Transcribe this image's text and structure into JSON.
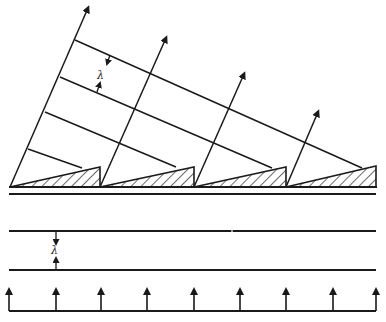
{
  "diagram": {
    "title": "",
    "stroke_color": "#1a1a1a",
    "background": "#ffffff",
    "top_panel": {
      "description": "Blazed grating (sawtooth, hatched) with diffracted rays and wavefronts",
      "wavelength_label": "λ",
      "grating": {
        "baseline_y": 187,
        "teeth": [
          {
            "x0": 10,
            "x1": 100,
            "peak_y": 167
          },
          {
            "x0": 100,
            "x1": 194,
            "peak_y": 167
          },
          {
            "x0": 194,
            "x1": 286,
            "peak_y": 167
          },
          {
            "x0": 286,
            "x1": 376,
            "peak_y": 166
          }
        ],
        "double_line_y": [
          190,
          194
        ]
      },
      "rays": [
        {
          "from": [
            10,
            187
          ],
          "to": [
            88,
            8
          ]
        },
        {
          "from": [
            100,
            187
          ],
          "to": [
            166,
            38
          ]
        },
        {
          "from": [
            194,
            187
          ],
          "to": [
            244,
            74
          ]
        },
        {
          "from": [
            286,
            187
          ],
          "to": [
            318,
            112
          ]
        }
      ],
      "wavefronts": [
        {
          "from": [
            75,
            40
          ],
          "to": [
            362,
            168
          ]
        },
        {
          "from": [
            60,
            77
          ],
          "to": [
            272,
            168
          ]
        },
        {
          "from": [
            45,
            112
          ],
          "to": [
            176,
            167
          ]
        },
        {
          "from": [
            28,
            149
          ],
          "to": [
            82,
            168
          ]
        }
      ],
      "lambda_marker": {
        "down_arrow_tip": [
          108,
          66
        ],
        "up_arrow_tip": [
          100,
          80
        ],
        "label_pos": [
          99,
          64
        ]
      }
    },
    "bottom_panel": {
      "description": "Plane wavefronts with normally incident rays",
      "wavelength_label": "λ",
      "wavefront_lines_y": [
        231,
        270
      ],
      "wavefront_x": [
        9,
        376
      ],
      "lambda_marker_x": 56,
      "baseline_y": 311,
      "arrow_tip_y": 285,
      "arrow_x": [
        9,
        56,
        101,
        147,
        194,
        240,
        286,
        333,
        376
      ]
    }
  }
}
